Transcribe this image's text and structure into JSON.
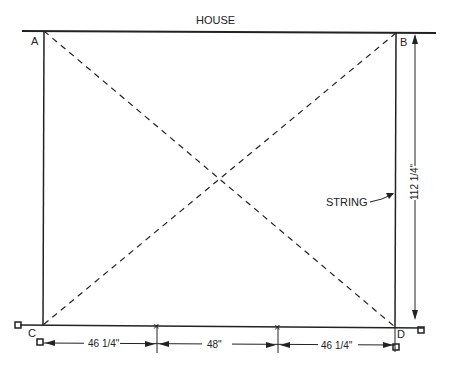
{
  "diagram": {
    "title": "HOUSE",
    "corners": {
      "a": "A",
      "b": "B",
      "c": "C",
      "d": "D"
    },
    "string_label": "STRING",
    "dimensions": {
      "vertical": "112 1/4\"",
      "bottom_left": "46 1/4\"",
      "bottom_middle": "48\"",
      "bottom_right": "46 1/4\""
    },
    "colors": {
      "ink": "#222222",
      "background": "#ffffff"
    }
  }
}
